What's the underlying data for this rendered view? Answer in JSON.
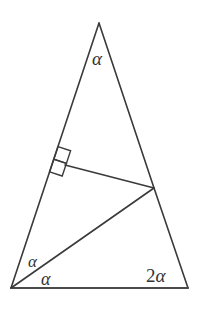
{
  "figure": {
    "kind": "geometry-diagram",
    "background_color": "#ffffff",
    "stroke_color": "#3a3a3a",
    "label_color": "#333333",
    "canvas": {
      "width": 200,
      "height": 313
    }
  },
  "points": {
    "apex": {
      "name": "A",
      "x": 99,
      "y": 23
    },
    "bottom_left": {
      "name": "B",
      "x": 11,
      "y": 288
    },
    "bottom_right": {
      "name": "C",
      "x": 188,
      "y": 288
    },
    "right_side_point": {
      "name": "D",
      "x": 154,
      "y": 188
    },
    "perpendicular_foot": {
      "name": "E",
      "x": 65,
      "y": 165
    }
  },
  "segments": [
    {
      "name": "left-edge",
      "from": "apex",
      "to": "bottom_left",
      "d": "M 99 23 L 11 288",
      "width": 1.6
    },
    {
      "name": "right-edge",
      "from": "apex",
      "to": "bottom_right",
      "d": "M 99 23 L 154 188 L 188 288",
      "width": 1.6
    },
    {
      "name": "base-edge",
      "from": "bottom_left",
      "to": "bottom_right",
      "d": "M 11 288 L 188 288",
      "width": 2.0
    },
    {
      "name": "altitude-segment",
      "from": "perpendicular_foot",
      "to": "right_side_point",
      "d": "M 65 165 L 154 188",
      "width": 1.6
    },
    {
      "name": "cevian-segment",
      "from": "bottom_left",
      "to": "right_side_point",
      "d": "M 11 288 L 154 188",
      "width": 1.6
    }
  ],
  "right_angle_marker": {
    "name": "right-angle-square",
    "at_point": "perpendicular_foot",
    "size": 13,
    "path": "M 58.0 146.6 L 70.6 150.8 L 66.4 163.4 L 53.8 159.2 Z",
    "inner_path": "M 53.8 159.2 L 66.4 163.4 L 62.2 176.0 L 49.6 171.8 Z",
    "stroke_width": 1.4
  },
  "labels": {
    "apex_angle": "α",
    "bottom_left_upper_angle": "α",
    "bottom_left_lower_angle": "α",
    "bottom_right_angle_coefficient": "2",
    "bottom_right_angle_symbol": "α"
  }
}
